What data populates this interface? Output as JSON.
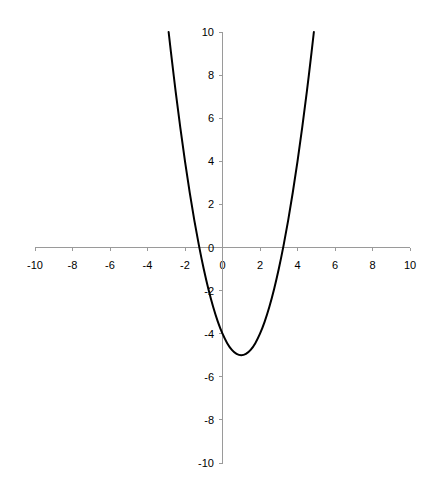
{
  "chart_data": {
    "type": "line",
    "title": "",
    "xlabel": "",
    "ylabel": "",
    "function": "y = x^2 - 2x - 4",
    "xlim": [
      -10,
      10
    ],
    "ylim": [
      -10,
      10
    ],
    "grid": false,
    "legend": null,
    "x_ticks": [
      "-10",
      "-8",
      "-6",
      "-4",
      "-2",
      "0",
      "2",
      "4",
      "6",
      "8",
      "10"
    ],
    "y_ticks": [
      "10",
      "8",
      "6",
      "4",
      "2",
      "0",
      "-2",
      "-4",
      "-6",
      "-8",
      "-10"
    ],
    "series": [
      {
        "name": "parabola",
        "color": "#000000",
        "x": [
          -2.873,
          -2.75,
          -2.5,
          -2.25,
          -2,
          -1.75,
          -1.5,
          -1.25,
          -1,
          -0.75,
          -0.5,
          -0.25,
          0,
          0.25,
          0.5,
          0.75,
          1,
          1.25,
          1.5,
          1.75,
          2,
          2.25,
          2.5,
          2.75,
          3,
          3.25,
          3.5,
          3.75,
          4,
          4.25,
          4.5,
          4.75,
          4.873
        ],
        "y": [
          10,
          9.0625,
          7.25,
          5.5625,
          4,
          2.5625,
          1.25,
          0.0625,
          -1,
          -1.9375,
          -2.75,
          -3.4375,
          -4,
          -4.4375,
          -4.75,
          -4.9375,
          -5,
          -4.9375,
          -4.75,
          -4.4375,
          -4,
          -3.4375,
          -2.75,
          -1.9375,
          -1,
          0.0625,
          1.25,
          2.5625,
          4,
          5.5625,
          7.25,
          9.0625,
          10
        ]
      }
    ],
    "annotations": {
      "vertex": [
        1,
        -5
      ],
      "y_intercept": [
        0,
        -4
      ],
      "x_intercepts": [
        -1.236,
        3.236
      ]
    },
    "colors": {
      "axis": "#9a9a9a",
      "curve": "#000000",
      "background": "#ffffff"
    }
  }
}
